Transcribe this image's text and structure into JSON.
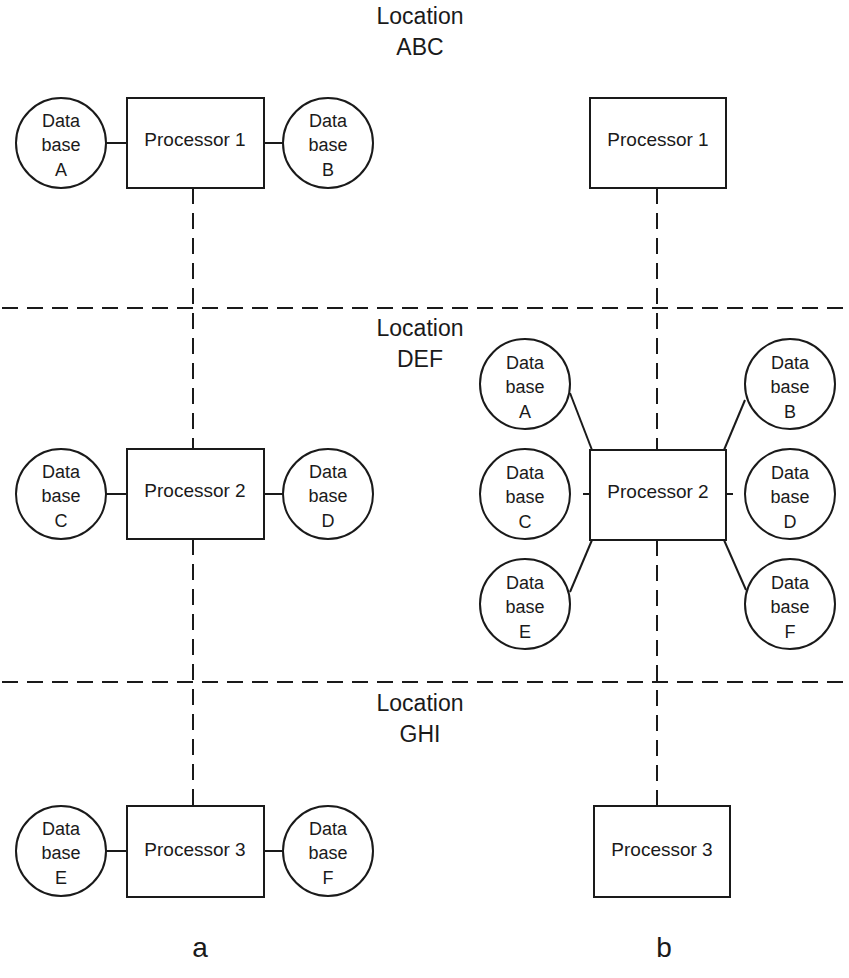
{
  "locations": [
    {
      "line1": "Location",
      "line2": "ABC"
    },
    {
      "line1": "Location",
      "line2": "DEF"
    },
    {
      "line1": "Location",
      "line2": "GHI"
    }
  ],
  "panel_a": {
    "caption": "a",
    "processors": [
      "Processor 1",
      "Processor 2",
      "Processor 3"
    ],
    "databases": [
      {
        "l1": "Data",
        "l2": "base",
        "l3": "A"
      },
      {
        "l1": "Data",
        "l2": "base",
        "l3": "B"
      },
      {
        "l1": "Data",
        "l2": "base",
        "l3": "C"
      },
      {
        "l1": "Data",
        "l2": "base",
        "l3": "D"
      },
      {
        "l1": "Data",
        "l2": "base",
        "l3": "E"
      },
      {
        "l1": "Data",
        "l2": "base",
        "l3": "F"
      }
    ]
  },
  "panel_b": {
    "caption": "b",
    "processors": [
      "Processor 1",
      "Processor 2",
      "Processor 3"
    ],
    "databases": [
      {
        "l1": "Data",
        "l2": "base",
        "l3": "A"
      },
      {
        "l1": "Data",
        "l2": "base",
        "l3": "B"
      },
      {
        "l1": "Data",
        "l2": "base",
        "l3": "C"
      },
      {
        "l1": "Data",
        "l2": "base",
        "l3": "D"
      },
      {
        "l1": "Data",
        "l2": "base",
        "l3": "E"
      },
      {
        "l1": "Data",
        "l2": "base",
        "l3": "F"
      }
    ]
  }
}
